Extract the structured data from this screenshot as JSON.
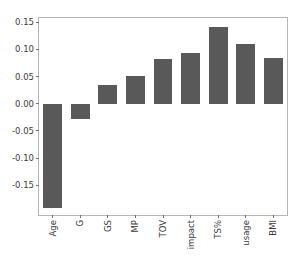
{
  "chart_data": {
    "type": "bar",
    "title": "",
    "subtitle": "",
    "xlabel": "",
    "ylabel": "",
    "categories": [
      "Age",
      "G",
      "GS",
      "MP",
      "TOV",
      "impact",
      "TS%",
      "usage",
      "BMI"
    ],
    "values": [
      -0.192,
      -0.028,
      0.035,
      0.051,
      0.082,
      0.094,
      0.142,
      0.11,
      0.085
    ],
    "series": [
      {
        "name": "",
        "values": [
          -0.192,
          -0.028,
          0.035,
          0.051,
          0.082,
          0.094,
          0.142,
          0.11,
          0.085
        ]
      }
    ],
    "ylim": [
      -0.205,
      0.158
    ],
    "yticks": [
      0.15,
      0.1,
      0.05,
      0.0,
      -0.05,
      -0.1,
      -0.15
    ],
    "ytick_labels": [
      "0.15",
      "0.10",
      "0.05",
      "0.00",
      "-0.05",
      "-0.10",
      "-0.15"
    ],
    "xtick_labels": [
      "Age",
      "G",
      "GS",
      "MP",
      "TOV",
      "impact",
      "TS%",
      "usage",
      "BMI"
    ],
    "xtick_rotation": 90,
    "grid": false,
    "legend": null,
    "legend_position": "none",
    "bar_color": "#595959",
    "axes_color": "#b5b5b5",
    "tick_color": "#6f6f6f",
    "background_color": "#ffffff",
    "annotations": []
  }
}
